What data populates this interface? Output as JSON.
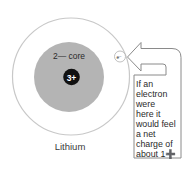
{
  "diagram": {
    "atom_name": "Lithium",
    "core_label": "2— core",
    "nucleus_label": "3+",
    "electron_label": "e⁻",
    "note_lines": [
      "If an",
      "electron",
      "were",
      "here it",
      "would feel",
      "a net",
      "charge of",
      "about 1➕"
    ],
    "note_text": "If an electron were here it would feel a net charge of about 1+",
    "colors": {
      "orbit": "#c8c8c8",
      "core": "#b4b4b4",
      "nucleus": "#111111",
      "arrow_outline": "#8a8a8a"
    }
  }
}
